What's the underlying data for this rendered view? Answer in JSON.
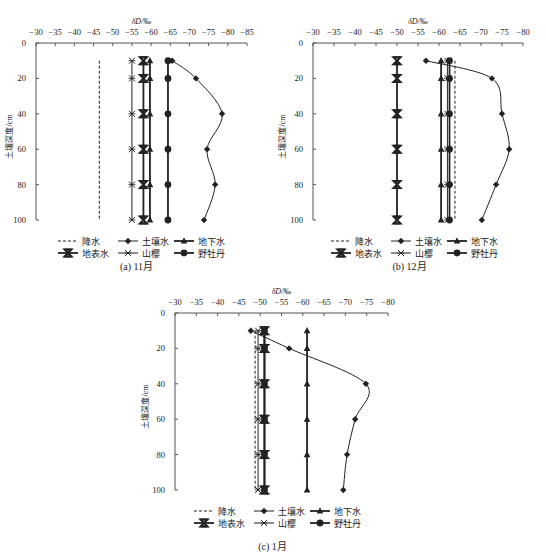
{
  "figure": {
    "series_names": [
      "降水",
      "土壤水",
      "地下水",
      "地表水",
      "山樱",
      "野牡丹"
    ],
    "colors": {
      "line": "#222222",
      "axis": "#555555",
      "background": "#ffffff"
    }
  },
  "chart_data": [
    {
      "type": "line",
      "title": "(a) 11月",
      "xlabel": "δD/‰",
      "ylabel": "土壤深度/cm",
      "xlim": [
        -30,
        -85
      ],
      "ylim": [
        0,
        100
      ],
      "x_ticks": [
        "-30",
        "-35",
        "-40",
        "-45",
        "-50",
        "-55",
        "-60",
        "-65",
        "-70",
        "-75",
        "-80",
        "-85"
      ],
      "y_ticks": [
        "0",
        "20",
        "40",
        "60",
        "80",
        "100"
      ],
      "depths": [
        10,
        20,
        40,
        60,
        80,
        100
      ],
      "grid": false,
      "legend_position": "bottom",
      "series": [
        {
          "name": "降水",
          "marker": "none",
          "style": "dashed",
          "values": [
            -46.5,
            -46.5,
            -46.5,
            -46.5,
            -46.5,
            -46.5
          ]
        },
        {
          "name": "土壤水",
          "marker": "diamond",
          "style": "smooth",
          "values": [
            -65.5,
            -71.7,
            -78.5,
            -74.6,
            -76.7,
            -73.8
          ]
        },
        {
          "name": "地下水",
          "marker": "triangle",
          "style": "solid",
          "values": [
            -59.7,
            -59.7,
            -59.7,
            -59.7,
            -59.7,
            -59.7
          ]
        },
        {
          "name": "地表水",
          "marker": "bowtie",
          "style": "solid",
          "values": [
            -58,
            -58,
            -58,
            -58,
            -58,
            -58
          ]
        },
        {
          "name": "山樱",
          "marker": "asterisk",
          "style": "solid",
          "values": [
            -55,
            -55,
            -55,
            -55,
            -55,
            -55
          ]
        },
        {
          "name": "野牡丹",
          "marker": "circle",
          "style": "solid",
          "values": [
            -64.4,
            -64.4,
            -64.4,
            -64.4,
            -64.4,
            -64.4
          ]
        }
      ]
    },
    {
      "type": "line",
      "title": "(b) 12月",
      "xlabel": "δD/‰",
      "ylabel": "土壤深度/cm",
      "xlim": [
        -30,
        -80
      ],
      "ylim": [
        0,
        100
      ],
      "x_ticks": [
        "-30",
        "-35",
        "-40",
        "-45",
        "-50",
        "-55",
        "-60",
        "-65",
        "-70",
        "-75",
        "-80"
      ],
      "y_ticks": [
        "0",
        "20",
        "40",
        "60",
        "80",
        "100"
      ],
      "depths": [
        10,
        20,
        40,
        60,
        80,
        100
      ],
      "grid": false,
      "legend_position": "bottom",
      "series": [
        {
          "name": "降水",
          "marker": "none",
          "style": "dashed",
          "values": [
            -63.8,
            -63.8,
            -63.8,
            -63.8,
            -63.8,
            -63.8
          ]
        },
        {
          "name": "土壤水",
          "marker": "diamond",
          "style": "smooth",
          "values": [
            -56.9,
            -72.6,
            -75,
            -76.7,
            -73.6,
            -70.2
          ]
        },
        {
          "name": "地下水",
          "marker": "triangle",
          "style": "solid",
          "values": [
            -60.5,
            -60.5,
            -60.5,
            -60.5,
            -60.5,
            -60.5
          ]
        },
        {
          "name": "地表水",
          "marker": "bowtie",
          "style": "solid",
          "values": [
            -50,
            -50,
            -50,
            -50,
            -50,
            -50
          ]
        },
        {
          "name": "山樱",
          "marker": "asterisk",
          "style": "solid",
          "values": [
            -62,
            -62,
            -62,
            -62,
            -62,
            -62
          ]
        },
        {
          "name": "野牡丹",
          "marker": "circle",
          "style": "solid",
          "values": [
            -62.5,
            -62.5,
            -62.5,
            -62.5,
            -62.5,
            -62.5
          ]
        }
      ]
    },
    {
      "type": "line",
      "title": "(c) 1月",
      "xlabel": "δD/‰",
      "ylabel": "土壤深度/cm",
      "xlim": [
        -30,
        -80
      ],
      "ylim": [
        0,
        100
      ],
      "x_ticks": [
        "-30",
        "-35",
        "-40",
        "-45",
        "-50",
        "-55",
        "-60",
        "-65",
        "-70",
        "-75",
        "-80"
      ],
      "y_ticks": [
        "0",
        "20",
        "40",
        "60",
        "80",
        "100"
      ],
      "depths": [
        10,
        20,
        40,
        60,
        80,
        100
      ],
      "grid": false,
      "legend_position": "bottom",
      "series": [
        {
          "name": "降水",
          "marker": "none",
          "style": "dashed",
          "values": [
            -48.8,
            -48.8,
            -48.8,
            -48.8,
            -48.8,
            -48.8
          ]
        },
        {
          "name": "土壤水",
          "marker": "diamond",
          "style": "smooth",
          "values": [
            -47.8,
            -56.8,
            -74.8,
            -72.3,
            -70.4,
            -69.5
          ]
        },
        {
          "name": "地下水",
          "marker": "triangle",
          "style": "solid",
          "values": [
            -61,
            -61,
            -61,
            -61,
            -61,
            -61
          ]
        },
        {
          "name": "地表水",
          "marker": "bowtie",
          "style": "solid",
          "values": [
            -51,
            -51,
            -51,
            -51,
            -51,
            -51
          ]
        },
        {
          "name": "山樱",
          "marker": "asterisk",
          "style": "solid",
          "values": [
            -49.5,
            -49.5,
            -49.5,
            -49.5,
            -49.5,
            -49.5
          ]
        },
        {
          "name": "野牡丹",
          "marker": "circle",
          "style": "solid",
          "values": [
            -51,
            -51,
            -51,
            -51,
            -51,
            -51
          ]
        }
      ]
    }
  ]
}
